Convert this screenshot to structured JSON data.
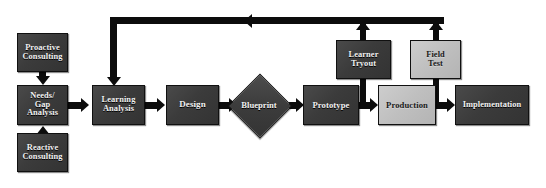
{
  "diagram": {
    "colors": {
      "dark_box": "#3b3b3b",
      "light_box": "#bfbfbf",
      "connector": "#0c0c0c",
      "dark_text": "#f2f2f2",
      "light_text": "#1a1a1a",
      "background": "#ffffff"
    },
    "nodes": [
      {
        "id": "proactive-consulting",
        "label": "Proactive\nConsulting",
        "shape": "rectangle",
        "fill": "dark",
        "x": 17,
        "y": 33,
        "w": 51,
        "h": 39,
        "font": 8.4
      },
      {
        "id": "needs-gap-analysis",
        "label": "Needs/\nGap\nAnalysis",
        "shape": "rectangle",
        "fill": "dark",
        "x": 17,
        "y": 85,
        "w": 51,
        "h": 40,
        "font": 8.4
      },
      {
        "id": "reactive-consulting",
        "label": "Reactive\nConsulting",
        "shape": "rectangle",
        "fill": "dark",
        "x": 17,
        "y": 133,
        "w": 51,
        "h": 39,
        "font": 8.4
      },
      {
        "id": "learning-analysis",
        "label": "Learning\nAnalysis",
        "shape": "rectangle",
        "fill": "dark",
        "x": 92,
        "y": 85,
        "w": 53,
        "h": 40,
        "font": 8.4
      },
      {
        "id": "design",
        "label": "Design",
        "shape": "rectangle",
        "fill": "dark",
        "x": 166,
        "y": 85,
        "w": 53,
        "h": 40,
        "font": 9
      },
      {
        "id": "blueprint",
        "label": "Blueprint",
        "shape": "diamond",
        "fill": "dark",
        "x": 228,
        "y": 75,
        "w": 62,
        "h": 60,
        "font": 8.6
      },
      {
        "id": "prototype",
        "label": "Prototype",
        "shape": "rectangle",
        "fill": "dark",
        "x": 303,
        "y": 85,
        "w": 56,
        "h": 40,
        "font": 8.6
      },
      {
        "id": "learner-tryout",
        "label": "Learner\nTryout",
        "shape": "rectangle",
        "fill": "dark",
        "x": 336,
        "y": 40,
        "w": 55,
        "h": 39,
        "font": 8.4
      },
      {
        "id": "production",
        "label": "Production",
        "shape": "rectangle",
        "fill": "light",
        "x": 378,
        "y": 85,
        "w": 58,
        "h": 40,
        "font": 8.6
      },
      {
        "id": "field-test",
        "label": "Field\nTest",
        "shape": "rectangle",
        "fill": "light",
        "x": 410,
        "y": 40,
        "w": 51,
        "h": 39,
        "font": 8.4
      },
      {
        "id": "implementation",
        "label": "Implementation",
        "shape": "rectangle",
        "fill": "dark",
        "x": 455,
        "y": 85,
        "w": 74,
        "h": 40,
        "font": 8.4
      }
    ],
    "connectors": [
      {
        "id": "proactive-to-needs",
        "from": "proactive-consulting",
        "to": "needs-gap-analysis",
        "direction": "down"
      },
      {
        "id": "reactive-to-needs",
        "from": "reactive-consulting",
        "to": "needs-gap-analysis",
        "direction": "up"
      },
      {
        "id": "needs-to-learning",
        "from": "needs-gap-analysis",
        "to": "learning-analysis",
        "direction": "right"
      },
      {
        "id": "learning-to-design",
        "from": "learning-analysis",
        "to": "design",
        "direction": "right"
      },
      {
        "id": "design-to-blueprint",
        "from": "design",
        "to": "blueprint",
        "direction": "right"
      },
      {
        "id": "blueprint-to-prototype",
        "from": "blueprint",
        "to": "prototype",
        "direction": "right"
      },
      {
        "id": "prototype-to-production",
        "from": "prototype",
        "to": "production",
        "direction": "right"
      },
      {
        "id": "production-to-implementation",
        "from": "production",
        "to": "implementation",
        "direction": "right"
      },
      {
        "id": "prototype-to-learner-tryout",
        "from": "prototype",
        "to": "learner-tryout",
        "direction": "up"
      },
      {
        "id": "production-to-field-test",
        "from": "production",
        "to": "field-test",
        "direction": "up"
      },
      {
        "id": "learner-tryout-feedback",
        "from": "learner-tryout",
        "to": "feedback-bus",
        "direction": "up"
      },
      {
        "id": "field-test-feedback",
        "from": "field-test",
        "to": "feedback-bus",
        "direction": "up"
      },
      {
        "id": "feedback-loop-to-learning-analysis",
        "from": "feedback-bus",
        "to": "learning-analysis",
        "direction": "left-then-down"
      }
    ]
  }
}
